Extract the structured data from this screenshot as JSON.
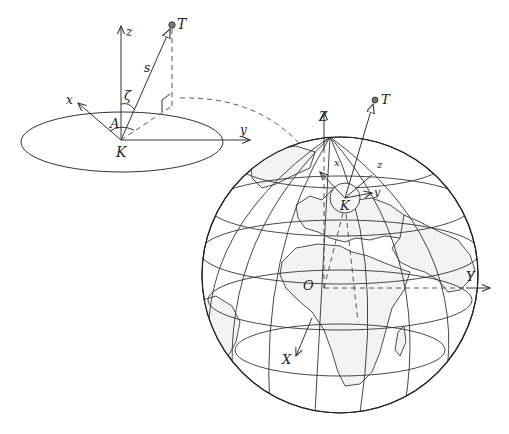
{
  "figure": {
    "local_frame": {
      "axes": {
        "z": "z",
        "x": "x",
        "y": "y"
      },
      "origin": "K",
      "target": "T",
      "distance": "s",
      "zenith_angle": "ζ",
      "azimuth": "A"
    },
    "global_frame": {
      "axes": {
        "Z": "Z",
        "Y": "Y",
        "X": "X"
      },
      "origin": "O",
      "station": "K",
      "target": "T",
      "local_axes": {
        "x": "x",
        "y": "y",
        "z": "z"
      }
    }
  }
}
